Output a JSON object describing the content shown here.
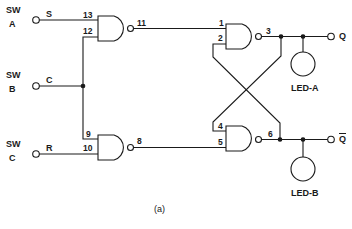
{
  "switches": [
    {
      "id": "sw-a",
      "line1": "SW",
      "line2": "A",
      "signal": "S"
    },
    {
      "id": "sw-b",
      "line1": "SW",
      "line2": "B",
      "signal": "C"
    },
    {
      "id": "sw-c",
      "line1": "SW",
      "line2": "C",
      "signal": "R"
    }
  ],
  "gates": [
    {
      "id": "nand-1",
      "inputs": [
        "13",
        "12"
      ],
      "output": "11"
    },
    {
      "id": "nand-2",
      "inputs": [
        "9",
        "10"
      ],
      "output": "8"
    },
    {
      "id": "nand-3",
      "inputs": [
        "1",
        "2"
      ],
      "output": "3"
    },
    {
      "id": "nand-4",
      "inputs": [
        "4",
        "5"
      ],
      "output": "6"
    }
  ],
  "outputs": {
    "q": "Q",
    "q_bar": "Q"
  },
  "leds": {
    "a": "LED-A",
    "b": "LED-B"
  },
  "caption": "(a)",
  "colors": {
    "line": "#1a1a1a",
    "background": "#ffffff"
  }
}
